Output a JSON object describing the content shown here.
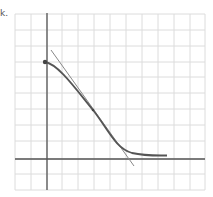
{
  "problem_label": "k.",
  "graph": {
    "grid": {
      "x_lines": [
        15,
        31,
        47,
        62,
        78,
        94,
        110,
        126,
        142,
        158,
        174,
        190,
        205
      ],
      "y_lines": [
        14,
        30,
        46,
        62,
        77,
        93,
        109,
        125,
        141,
        159,
        174,
        190
      ],
      "color": "#dcdcdc"
    },
    "axes": {
      "origin_px": [
        47,
        159
      ],
      "unit_px": 15.8,
      "x_range": [
        -2,
        10
      ],
      "y_range": [
        -2,
        9
      ],
      "color": "#555555"
    },
    "curve": {
      "description": "decreasing curve with horizontal asymptote",
      "start": [
        0,
        6.2
      ],
      "tangent_point": [
        2.9,
        3.1
      ],
      "end": [
        7.6,
        0.25
      ],
      "color": "#555555"
    },
    "tangent_line": {
      "from_px": [
        51,
        50
      ],
      "to_px": [
        134,
        166
      ],
      "color": "#888888"
    },
    "start_dot": {
      "x": 0,
      "y": 6.2,
      "color": "#444444"
    }
  }
}
